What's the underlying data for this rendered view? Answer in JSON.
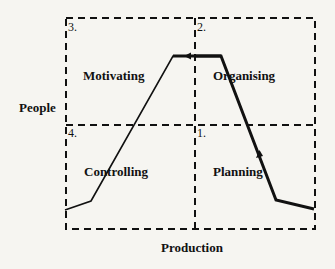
{
  "diagram": {
    "axes": {
      "x_label": "Production",
      "y_label": "People"
    },
    "quadrants": [
      {
        "number": "1.",
        "label": "Planning"
      },
      {
        "number": "2.",
        "label": "Organising"
      },
      {
        "number": "3.",
        "label": "Motivating"
      },
      {
        "number": "4.",
        "label": "Controlling"
      }
    ],
    "curve_points": [
      [
        65,
        210
      ],
      [
        91,
        201
      ],
      [
        173,
        56
      ],
      [
        221,
        56
      ],
      [
        276,
        200
      ],
      [
        314,
        209
      ]
    ],
    "colors": {
      "line": "#111111",
      "background": "#f6f5f1"
    }
  }
}
